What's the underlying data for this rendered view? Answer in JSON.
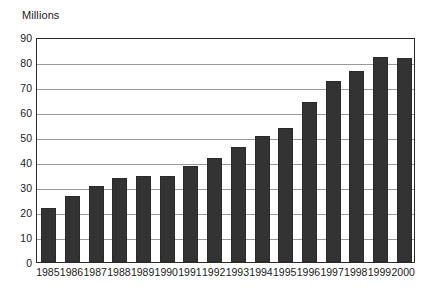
{
  "chart_data": {
    "type": "bar",
    "title": "",
    "subtitle": "",
    "xlabel": "",
    "ylabel": "Millions",
    "ylim": [
      0,
      90
    ],
    "ytick_step": 10,
    "yticks": [
      0,
      10,
      20,
      30,
      40,
      50,
      60,
      70,
      80,
      90
    ],
    "grid": true,
    "legend": false,
    "legend_position": "none",
    "categories": [
      "1985",
      "1986",
      "1987",
      "1988",
      "1989",
      "1990",
      "1991",
      "1992",
      "1993",
      "1994",
      "1995",
      "1996",
      "1997",
      "1998",
      "1999",
      "2000"
    ],
    "values": [
      21.5,
      26.5,
      30.5,
      33.5,
      34.5,
      34.5,
      38.5,
      41.5,
      46.0,
      50.5,
      53.5,
      64.0,
      72.5,
      76.5,
      82.0,
      81.5
    ],
    "series": [
      {
        "name": "Millions",
        "color": "#333333",
        "values": [
          21.5,
          26.5,
          30.5,
          33.5,
          34.5,
          34.5,
          38.5,
          41.5,
          46.0,
          50.5,
          53.5,
          64.0,
          72.5,
          76.5,
          82.0,
          81.5
        ]
      }
    ],
    "annotations": []
  },
  "style": {
    "bar_color": "#333333",
    "bar_border_color": "#2a2a2a",
    "gridline_color": "#9a9a9a",
    "frame_color": "#2b2b2b",
    "text_color": "#1a1a1a",
    "background": "#ffffff"
  }
}
